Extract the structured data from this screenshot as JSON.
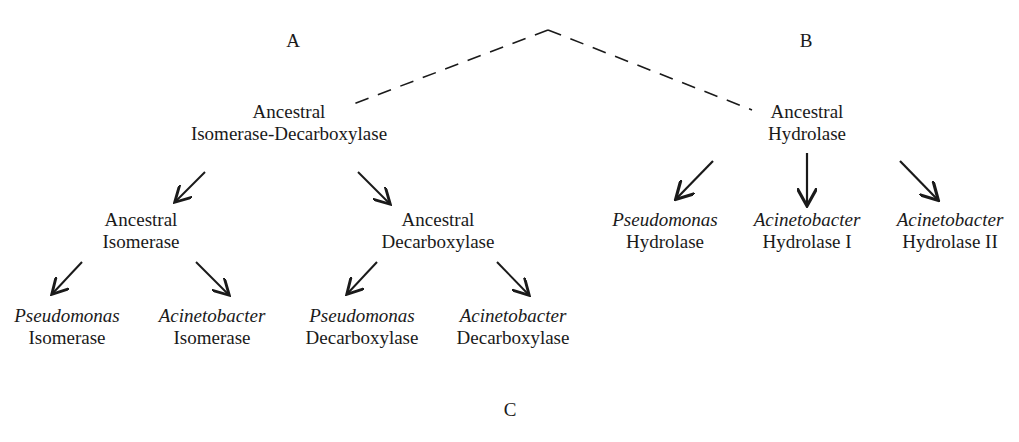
{
  "panel_labels": {
    "a": "A",
    "b": "B",
    "c": "C"
  },
  "root": {
    "left_branch_style": "dashed",
    "right_branch_style": "dashed"
  },
  "nodes": {
    "anc_iso_dec": {
      "line1": "Ancestral",
      "line2": "Isomerase-Decarboxylase"
    },
    "anc_hydrolase": {
      "line1": "Ancestral",
      "line2": "Hydrolase"
    },
    "anc_isomerase": {
      "line1": "Ancestral",
      "line2": "Isomerase"
    },
    "anc_decarboxylase": {
      "line1": "Ancestral",
      "line2": "Decarboxylase"
    },
    "pseudo_isomerase": {
      "genus": "Pseudomonas",
      "enzyme": "Isomerase"
    },
    "acineto_isomerase": {
      "genus": "Acinetobacter",
      "enzyme": "Isomerase"
    },
    "pseudo_decarboxylase": {
      "genus": "Pseudomonas",
      "enzyme": "Decarboxylase"
    },
    "acineto_decarboxylase": {
      "genus": "Acinetobacter",
      "enzyme": "Decarboxylase"
    },
    "pseudo_hydrolase": {
      "genus": "Pseudomonas",
      "enzyme": "Hydrolase"
    },
    "acineto_hydrolase_1": {
      "genus": "Acinetobacter",
      "enzyme": "Hydrolase I"
    },
    "acineto_hydrolase_2": {
      "genus": "Acinetobacter",
      "enzyme": "Hydrolase II"
    }
  },
  "colors": {
    "ink": "#1a1a1a",
    "background": "#ffffff"
  }
}
